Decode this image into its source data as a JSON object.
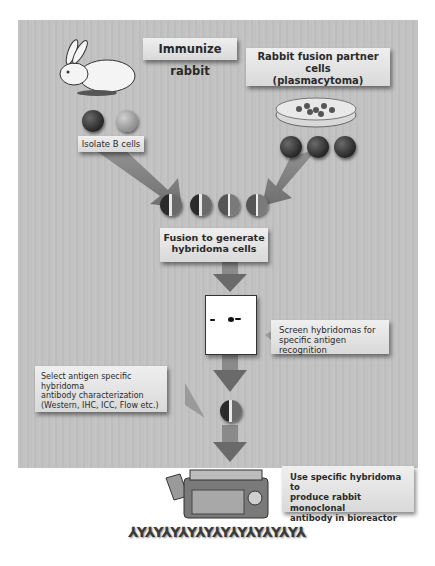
{
  "diagram": {
    "type": "flowchart",
    "title": "",
    "steps": [
      {
        "id": "immunize",
        "label": "Immunize rabbit"
      },
      {
        "id": "fusion_partner",
        "label_line1": "Rabbit fusion partner cells",
        "label_line2": "(plasmacytoma)"
      },
      {
        "id": "isolate",
        "label": "Isolate B cells"
      },
      {
        "id": "fusion",
        "label_line1": "Fusion to generate",
        "label_line2": "hybridoma cells"
      },
      {
        "id": "screen",
        "label_line1": "Screen hybridomas for",
        "label_line2": "specific antigen recognition"
      },
      {
        "id": "select",
        "label_line1": "Select antigen specific hybridoma",
        "label_line2": "antibody characterization",
        "label_line3": "(Western, IHC, ICC, Flow etc.)"
      },
      {
        "id": "produce",
        "label_line1": "Use specific hybridoma to",
        "label_line2": "produce rabbit monoclonal",
        "label_line3": "antibody in bioreactor"
      }
    ],
    "edges": [
      [
        "immunize",
        "isolate"
      ],
      [
        "fusion_partner",
        "fusion"
      ],
      [
        "isolate",
        "fusion"
      ],
      [
        "fusion",
        "screen"
      ],
      [
        "screen",
        "select"
      ],
      [
        "select",
        "produce"
      ]
    ],
    "icons": [
      "rabbit-icon",
      "petri-dish-icon",
      "b-cell-icon",
      "plasmacytoma-cell-icon",
      "hybridoma-cell-icon",
      "western-blot-icon",
      "bioreactor-icon",
      "antibody-icon"
    ],
    "colors": {
      "panel": "#c2c2c2",
      "label_bg": "#e6e6e6",
      "arrow": "#7a7a7a",
      "text": "#2a2a2a"
    }
  }
}
